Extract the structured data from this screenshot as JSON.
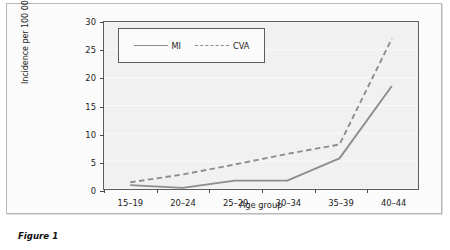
{
  "caption": "Figure 1",
  "legend": {
    "position": "top-left-inside",
    "entries": [
      {
        "label": "MI",
        "style": "solid"
      },
      {
        "label": "CVA",
        "style": "dashed"
      }
    ]
  },
  "axes": {
    "y_title": "Incidence per 100 000 women–years",
    "x_title": "Age group",
    "y_ticks": [
      "0",
      "5",
      "10",
      "15",
      "20",
      "25",
      "30"
    ],
    "x_ticks": [
      "15–19",
      "20–24",
      "25–29",
      "30–34",
      "35–39",
      "40–44"
    ]
  },
  "colors": {
    "line": "#8d8d8d",
    "frame": "#5d5d5d",
    "plot_background": "#f1f1f1",
    "gridline": "#fafafa",
    "text": "#1d1d1d"
  },
  "chart_data": {
    "type": "line",
    "title": "",
    "xlabel": "Age group",
    "ylabel": "Incidence per 100 000 women–years",
    "categories": [
      "15–19",
      "20–24",
      "25–29",
      "30–34",
      "35–39",
      "40–44"
    ],
    "ylim": [
      0,
      30
    ],
    "yticks": [
      0,
      5,
      10,
      15,
      20,
      25,
      30
    ],
    "grid": true,
    "legend_position": "upper left",
    "series": [
      {
        "name": "MI",
        "style": "solid",
        "values": [
          0.7,
          0.2,
          1.5,
          1.5,
          5.5,
          18.5
        ]
      },
      {
        "name": "CVA",
        "style": "dashed",
        "values": [
          1.2,
          2.6,
          4.4,
          6.3,
          8.0,
          27.0
        ]
      }
    ]
  }
}
